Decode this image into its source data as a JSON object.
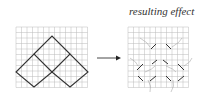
{
  "caption": "resulting effect",
  "left_diagram": {
    "grid": {
      "x": 16,
      "y": 27,
      "cols": 13,
      "rows": 11,
      "cell": 5.5
    },
    "shapes": "three diamonds forming a pyramid",
    "line_color": "#333333",
    "grid_color": "#bbbbbb"
  },
  "arrow": {
    "from": [
      97,
      58
    ],
    "to": [
      120,
      58
    ]
  },
  "right_diagram": {
    "grid": {
      "x": 128,
      "y": 27,
      "cols": 11,
      "rows": 11,
      "cell": 5.5
    },
    "effect": "grid warped around diamond edges"
  }
}
